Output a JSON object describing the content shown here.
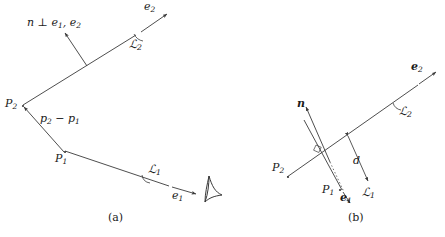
{
  "figure": {
    "background_color": "#ffffff",
    "stroke_color": "#3a3a3a",
    "text_color": "#1a1a1a",
    "panels": [
      {
        "id": "a",
        "caption": "(a)",
        "labels": {
          "normal_condition": "n ⊥ e",
          "normal_condition_sub1": "1",
          "normal_condition_tail": ", e",
          "normal_condition_sub2": "2",
          "e2": "e",
          "e2_sub": "2",
          "line2": "ℒ",
          "line2_sub": "2",
          "P2": "P",
          "P2_sub": "2",
          "P1": "P",
          "P1_sub": "1",
          "delta_p": "p",
          "delta_p_sub1": "2",
          "delta_p_minus": " − p",
          "delta_p_sub2": "1",
          "line1": "ℒ",
          "line1_sub": "1",
          "e1": "e",
          "e1_sub": "1"
        }
      },
      {
        "id": "b",
        "caption": "(b)",
        "labels": {
          "n": "n",
          "e2": "e",
          "e2_sub": "2",
          "line2": "ℒ",
          "line2_sub": "2",
          "P2": "P",
          "P2_sub": "2",
          "P1": "P",
          "P1_sub": "1",
          "e1": "e",
          "e1_sub": "1",
          "line1": "ℒ",
          "line1_sub": "1",
          "distance": "d"
        }
      }
    ]
  }
}
